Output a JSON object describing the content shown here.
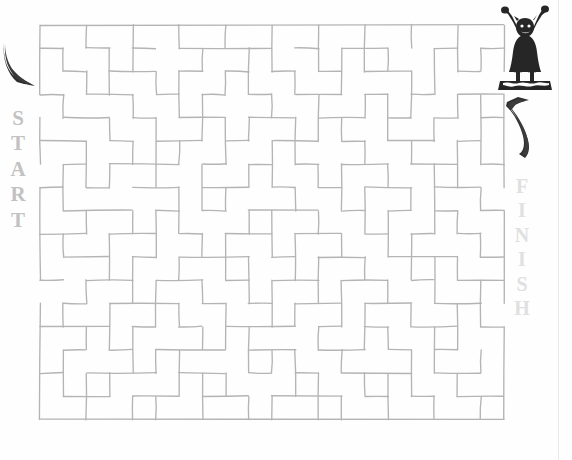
{
  "page": {
    "background_color": "#fefefe",
    "wall_color": "#b4b4b4",
    "start_label_color": "#c2c2c2",
    "finish_label_color": "#e0e0e0",
    "art_color": "#2b2b2b"
  },
  "labels": {
    "start": {
      "text": "START",
      "letters": [
        "S",
        "T",
        "A",
        "R",
        "T"
      ]
    },
    "finish": {
      "text": "FINISH",
      "letters": [
        "F",
        "I",
        "N",
        "I",
        "S",
        "H"
      ]
    }
  },
  "icons": {
    "start_arrow": "curved-arrow-down-right-icon",
    "finish_arrow": "curved-arrow-up-right-icon",
    "figure": "cheering-figure-icon"
  },
  "maze": {
    "type": "rectangular-grid-maze",
    "grid_columns": 20,
    "grid_rows": 17,
    "cell_size": 23.2,
    "origin_x": 40,
    "origin_y": 25,
    "entrance": {
      "side": "left",
      "label": "START",
      "row": 3
    },
    "exit": {
      "side": "right",
      "label": "FINISH",
      "row": 2
    },
    "walls_h": [
      [
        0,
        0,
        20
      ],
      [
        1,
        0,
        1
      ],
      [
        1,
        2,
        3
      ],
      [
        1,
        4,
        5
      ],
      [
        1,
        6,
        10
      ],
      [
        1,
        11,
        12
      ],
      [
        1,
        13,
        15
      ],
      [
        1,
        17,
        18
      ],
      [
        1,
        19,
        20
      ],
      [
        2,
        1,
        2
      ],
      [
        2,
        3,
        5
      ],
      [
        2,
        6,
        7
      ],
      [
        2,
        8,
        9
      ],
      [
        2,
        10,
        11
      ],
      [
        2,
        12,
        13
      ],
      [
        2,
        14,
        16
      ],
      [
        2,
        18,
        19
      ],
      [
        3,
        0,
        1
      ],
      [
        3,
        2,
        4
      ],
      [
        3,
        5,
        6
      ],
      [
        3,
        7,
        8
      ],
      [
        3,
        9,
        10
      ],
      [
        3,
        11,
        13
      ],
      [
        3,
        14,
        15
      ],
      [
        3,
        16,
        17
      ],
      [
        3,
        18,
        20
      ],
      [
        4,
        1,
        3
      ],
      [
        4,
        4,
        5
      ],
      [
        4,
        6,
        8
      ],
      [
        4,
        9,
        11
      ],
      [
        4,
        12,
        14
      ],
      [
        4,
        15,
        16
      ],
      [
        4,
        17,
        18
      ],
      [
        4,
        19,
        20
      ],
      [
        5,
        0,
        2
      ],
      [
        5,
        3,
        4
      ],
      [
        5,
        5,
        7
      ],
      [
        5,
        8,
        9
      ],
      [
        5,
        10,
        12
      ],
      [
        5,
        13,
        14
      ],
      [
        5,
        15,
        17
      ],
      [
        5,
        18,
        19
      ],
      [
        6,
        1,
        2
      ],
      [
        6,
        3,
        6
      ],
      [
        6,
        7,
        8
      ],
      [
        6,
        9,
        10
      ],
      [
        6,
        11,
        12
      ],
      [
        6,
        13,
        15
      ],
      [
        6,
        16,
        18
      ],
      [
        6,
        19,
        20
      ],
      [
        7,
        0,
        1
      ],
      [
        7,
        2,
        3
      ],
      [
        7,
        4,
        6
      ],
      [
        7,
        7,
        9
      ],
      [
        7,
        10,
        11
      ],
      [
        7,
        12,
        13
      ],
      [
        7,
        14,
        16
      ],
      [
        7,
        17,
        19
      ],
      [
        8,
        1,
        4
      ],
      [
        8,
        5,
        6
      ],
      [
        8,
        7,
        8
      ],
      [
        8,
        9,
        12
      ],
      [
        8,
        13,
        14
      ],
      [
        8,
        15,
        16
      ],
      [
        8,
        17,
        18
      ],
      [
        8,
        19,
        20
      ],
      [
        9,
        0,
        2
      ],
      [
        9,
        3,
        5
      ],
      [
        9,
        6,
        7
      ],
      [
        9,
        8,
        10
      ],
      [
        9,
        11,
        13
      ],
      [
        9,
        14,
        15
      ],
      [
        9,
        16,
        17
      ],
      [
        9,
        18,
        19
      ],
      [
        10,
        1,
        3
      ],
      [
        10,
        4,
        5
      ],
      [
        10,
        6,
        9
      ],
      [
        10,
        10,
        11
      ],
      [
        10,
        12,
        14
      ],
      [
        10,
        15,
        18
      ],
      [
        10,
        19,
        20
      ],
      [
        11,
        0,
        1
      ],
      [
        11,
        2,
        4
      ],
      [
        11,
        5,
        7
      ],
      [
        11,
        8,
        9
      ],
      [
        11,
        10,
        12
      ],
      [
        11,
        13,
        15
      ],
      [
        11,
        16,
        17
      ],
      [
        11,
        18,
        20
      ],
      [
        12,
        1,
        2
      ],
      [
        12,
        3,
        6
      ],
      [
        12,
        7,
        8
      ],
      [
        12,
        9,
        10
      ],
      [
        12,
        11,
        13
      ],
      [
        12,
        14,
        16
      ],
      [
        12,
        17,
        19
      ],
      [
        13,
        0,
        3
      ],
      [
        13,
        4,
        5
      ],
      [
        13,
        6,
        7
      ],
      [
        13,
        8,
        11
      ],
      [
        13,
        12,
        13
      ],
      [
        13,
        14,
        15
      ],
      [
        13,
        16,
        18
      ],
      [
        13,
        19,
        20
      ],
      [
        14,
        1,
        2
      ],
      [
        14,
        3,
        4
      ],
      [
        14,
        5,
        8
      ],
      [
        14,
        9,
        11
      ],
      [
        14,
        12,
        14
      ],
      [
        14,
        15,
        16
      ],
      [
        14,
        17,
        18
      ],
      [
        15,
        0,
        1
      ],
      [
        15,
        2,
        5
      ],
      [
        15,
        6,
        8
      ],
      [
        15,
        9,
        10
      ],
      [
        15,
        11,
        12
      ],
      [
        15,
        13,
        16
      ],
      [
        15,
        17,
        19
      ],
      [
        16,
        1,
        3
      ],
      [
        16,
        4,
        6
      ],
      [
        16,
        7,
        9
      ],
      [
        16,
        10,
        13
      ],
      [
        16,
        14,
        15
      ],
      [
        16,
        16,
        17
      ],
      [
        16,
        18,
        20
      ],
      [
        17,
        0,
        20
      ]
    ],
    "walls_v": [
      [
        0,
        0,
        3
      ],
      [
        0,
        4,
        6
      ],
      [
        0,
        7,
        11
      ],
      [
        0,
        12,
        17
      ],
      [
        1,
        1,
        2
      ],
      [
        1,
        3,
        4
      ],
      [
        1,
        6,
        8
      ],
      [
        1,
        9,
        10
      ],
      [
        1,
        12,
        13
      ],
      [
        1,
        14,
        16
      ],
      [
        2,
        0,
        1
      ],
      [
        2,
        2,
        3
      ],
      [
        2,
        5,
        7
      ],
      [
        2,
        8,
        9
      ],
      [
        2,
        11,
        12
      ],
      [
        2,
        13,
        14
      ],
      [
        2,
        15,
        17
      ],
      [
        3,
        1,
        3
      ],
      [
        3,
        4,
        5
      ],
      [
        3,
        6,
        7
      ],
      [
        3,
        9,
        11
      ],
      [
        3,
        12,
        14
      ],
      [
        3,
        15,
        16
      ],
      [
        4,
        0,
        2
      ],
      [
        4,
        3,
        4
      ],
      [
        4,
        5,
        6
      ],
      [
        4,
        8,
        9
      ],
      [
        4,
        10,
        12
      ],
      [
        4,
        13,
        15
      ],
      [
        4,
        16,
        17
      ],
      [
        5,
        2,
        3
      ],
      [
        5,
        4,
        7
      ],
      [
        5,
        8,
        10
      ],
      [
        5,
        11,
        13
      ],
      [
        5,
        14,
        15
      ],
      [
        5,
        16,
        17
      ],
      [
        6,
        0,
        1
      ],
      [
        6,
        2,
        4
      ],
      [
        6,
        5,
        6
      ],
      [
        6,
        7,
        9
      ],
      [
        6,
        10,
        11
      ],
      [
        6,
        12,
        13
      ],
      [
        6,
        14,
        16
      ],
      [
        7,
        1,
        2
      ],
      [
        7,
        3,
        5
      ],
      [
        7,
        6,
        8
      ],
      [
        7,
        9,
        10
      ],
      [
        7,
        11,
        12
      ],
      [
        7,
        13,
        14
      ],
      [
        7,
        15,
        17
      ],
      [
        8,
        0,
        1
      ],
      [
        8,
        2,
        3
      ],
      [
        8,
        4,
        6
      ],
      [
        8,
        7,
        8
      ],
      [
        8,
        9,
        11
      ],
      [
        8,
        12,
        14
      ],
      [
        8,
        15,
        16
      ],
      [
        9,
        1,
        3
      ],
      [
        9,
        4,
        5
      ],
      [
        9,
        6,
        7
      ],
      [
        9,
        8,
        9
      ],
      [
        9,
        10,
        12
      ],
      [
        9,
        13,
        15
      ],
      [
        9,
        16,
        17
      ],
      [
        10,
        0,
        2
      ],
      [
        10,
        3,
        4
      ],
      [
        10,
        5,
        7
      ],
      [
        10,
        8,
        10
      ],
      [
        10,
        11,
        13
      ],
      [
        10,
        14,
        15
      ],
      [
        10,
        16,
        17
      ],
      [
        11,
        2,
        3
      ],
      [
        11,
        4,
        6
      ],
      [
        11,
        7,
        8
      ],
      [
        11,
        9,
        11
      ],
      [
        11,
        12,
        13
      ],
      [
        11,
        14,
        16
      ],
      [
        12,
        0,
        1
      ],
      [
        12,
        1,
        2
      ],
      [
        12,
        3,
        5
      ],
      [
        12,
        6,
        7
      ],
      [
        12,
        8,
        9
      ],
      [
        12,
        10,
        12
      ],
      [
        12,
        13,
        14
      ],
      [
        12,
        15,
        17
      ],
      [
        13,
        1,
        3
      ],
      [
        13,
        4,
        5
      ],
      [
        13,
        6,
        8
      ],
      [
        13,
        9,
        10
      ],
      [
        13,
        11,
        13
      ],
      [
        13,
        14,
        15
      ],
      [
        13,
        16,
        17
      ],
      [
        14,
        0,
        2
      ],
      [
        14,
        3,
        4
      ],
      [
        14,
        5,
        6
      ],
      [
        14,
        7,
        9
      ],
      [
        14,
        10,
        11
      ],
      [
        14,
        12,
        14
      ],
      [
        14,
        15,
        16
      ],
      [
        15,
        1,
        2
      ],
      [
        15,
        3,
        5
      ],
      [
        15,
        6,
        7
      ],
      [
        15,
        8,
        10
      ],
      [
        15,
        11,
        12
      ],
      [
        15,
        13,
        14
      ],
      [
        15,
        15,
        17
      ],
      [
        16,
        0,
        1
      ],
      [
        16,
        2,
        4
      ],
      [
        16,
        5,
        6
      ],
      [
        16,
        7,
        8
      ],
      [
        16,
        9,
        11
      ],
      [
        16,
        12,
        13
      ],
      [
        16,
        14,
        16
      ],
      [
        17,
        1,
        3
      ],
      [
        17,
        4,
        5
      ],
      [
        17,
        6,
        9
      ],
      [
        17,
        10,
        12
      ],
      [
        17,
        13,
        15
      ],
      [
        17,
        16,
        17
      ],
      [
        18,
        0,
        2
      ],
      [
        18,
        3,
        4
      ],
      [
        18,
        5,
        7
      ],
      [
        18,
        8,
        9
      ],
      [
        18,
        10,
        11
      ],
      [
        18,
        12,
        14
      ],
      [
        18,
        15,
        16
      ],
      [
        19,
        1,
        2
      ],
      [
        19,
        3,
        6
      ],
      [
        19,
        7,
        8
      ],
      [
        19,
        9,
        10
      ],
      [
        19,
        11,
        13
      ],
      [
        19,
        14,
        15
      ],
      [
        19,
        16,
        17
      ],
      [
        20,
        0,
        2
      ],
      [
        20,
        3,
        7
      ],
      [
        20,
        8,
        12
      ],
      [
        20,
        13,
        17
      ]
    ]
  }
}
